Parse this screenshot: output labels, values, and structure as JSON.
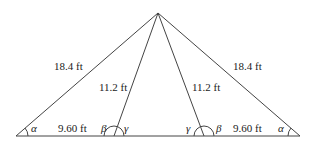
{
  "diagram": {
    "type": "triangle-geometry",
    "side_labels": {
      "left_outer": "18.4 ft",
      "right_outer": "18.4 ft",
      "left_inner": "11.2 ft",
      "right_inner": "11.2 ft",
      "left_base": "9.60 ft",
      "right_base": "9.60 ft"
    },
    "angle_labels": {
      "left_alpha": "α",
      "left_beta": "β",
      "left_gamma": "γ",
      "right_gamma": "γ",
      "right_beta": "β",
      "right_alpha": "α"
    },
    "colors": {
      "line": "#444444",
      "text": "#222222"
    }
  }
}
